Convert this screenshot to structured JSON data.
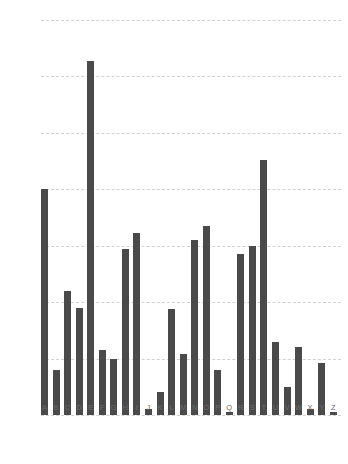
{
  "chart_data": {
    "type": "bar",
    "title": "",
    "subtitle": "",
    "xlabel": "",
    "ylabel": "",
    "categories": [
      "A",
      "B",
      "C",
      "D",
      "E",
      "F",
      "G",
      "H",
      "I",
      "J",
      "K",
      "L",
      "M",
      "N",
      "O",
      "P",
      "Q",
      "R",
      "S",
      "T",
      "U",
      "V",
      "W",
      "X",
      "Y",
      "Z"
    ],
    "values": [
      0.08,
      0.016,
      0.044,
      0.038,
      0.1255,
      0.023,
      0.02,
      0.059,
      0.0645,
      0.002,
      0.008,
      0.0375,
      0.0215,
      0.062,
      0.067,
      0.016,
      0.001,
      0.057,
      0.06,
      0.0905,
      0.026,
      0.01,
      0.024,
      0.002,
      0.0185,
      0.001
    ],
    "values_label": "Relative frequency",
    "series": [
      {
        "name": "Letter frequency",
        "values": [
          0.08,
          0.016,
          0.044,
          0.038,
          0.1255,
          0.023,
          0.02,
          0.059,
          0.0645,
          0.002,
          0.008,
          0.0375,
          0.0215,
          0.062,
          0.067,
          0.016,
          0.001,
          0.057,
          0.06,
          0.0905,
          0.026,
          0.01,
          0.024,
          0.002,
          0.0185,
          0.001
        ],
        "color": "#4a4a4a"
      }
    ],
    "ylim": [
      0,
      0.14
    ],
    "xlim_categorical": true,
    "yticks": [
      0,
      0.02,
      0.04,
      0.06,
      0.08,
      0.1,
      0.12,
      0.14
    ],
    "ytick_labels": [
      "0",
      "0.02",
      "0.04",
      "0.06",
      "0.08",
      "0.1",
      "0.12",
      "0.14"
    ],
    "grid": {
      "horizontal": true,
      "vertical": false,
      "style": "dashed",
      "color": "#c9c9c9"
    },
    "legend": {
      "visible": false,
      "position": "none",
      "entries": []
    },
    "annotations": [],
    "bar_color": "#4a4a4a",
    "background_color": "#ffffff",
    "axis_label_color": "#6b6b6b"
  }
}
